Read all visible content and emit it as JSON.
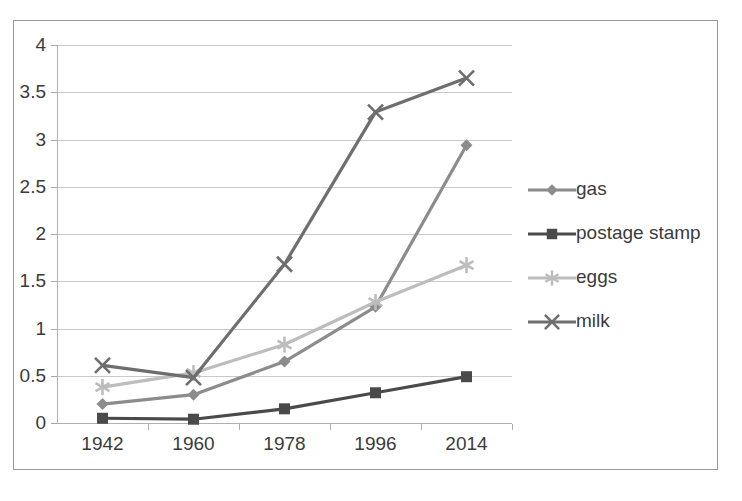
{
  "chart_data": {
    "type": "line",
    "title": "",
    "xlabel": "",
    "ylabel": "",
    "categories": [
      "1942",
      "1960",
      "1978",
      "1996",
      "2014"
    ],
    "x": [
      1942,
      1960,
      1978,
      1996,
      2014
    ],
    "ylim": [
      0,
      4
    ],
    "xlim": [
      1942,
      2014
    ],
    "y_ticks": [
      "0",
      "0.5",
      "1",
      "1.5",
      "2",
      "2.5",
      "3",
      "3.5",
      "4"
    ],
    "y_tick_values": [
      0,
      0.5,
      1,
      1.5,
      2,
      2.5,
      3,
      3.5,
      4
    ],
    "grid": true,
    "legend_position": "right",
    "series": [
      {
        "name": "gas",
        "marker": "diamond",
        "color": "#8c8c8c",
        "values": [
          0.2,
          0.3,
          0.65,
          1.23,
          2.94
        ]
      },
      {
        "name": "postage stamp",
        "marker": "square",
        "color": "#4a4a4a",
        "values": [
          0.05,
          0.04,
          0.15,
          0.32,
          0.49
        ]
      },
      {
        "name": "eggs",
        "marker": "star",
        "color": "#bdbdbd",
        "values": [
          0.38,
          0.53,
          0.83,
          1.28,
          1.67
        ]
      },
      {
        "name": "milk",
        "marker": "x",
        "color": "#6e6e6e",
        "values": [
          0.61,
          0.48,
          1.68,
          3.29,
          3.65
        ]
      }
    ]
  },
  "legend": {
    "entries": [
      {
        "label": "gas"
      },
      {
        "label": "postage stamp"
      },
      {
        "label": "eggs"
      },
      {
        "label": "milk"
      }
    ]
  },
  "axes": {
    "y_labels": [
      "4",
      "3.5",
      "3",
      "2.5",
      "2",
      "1.5",
      "1",
      "0.5",
      "0"
    ],
    "x_labels": [
      "1942",
      "1960",
      "1978",
      "1996",
      "2014"
    ]
  },
  "colors": {
    "gas": "#8c8c8c",
    "postage_stamp": "#4a4a4a",
    "eggs": "#bdbdbd",
    "milk": "#6e6e6e",
    "gridline": "#c9c9c9",
    "frame": "#9a9a9a",
    "text": "#3b3b3b"
  }
}
